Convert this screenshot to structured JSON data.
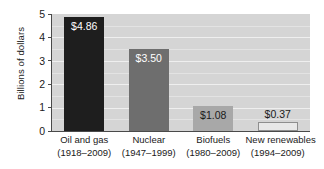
{
  "chart_data": {
    "type": "bar",
    "title": "",
    "xlabel": "",
    "ylabel": "Billions of dollars",
    "ylim": [
      0,
      5
    ],
    "yticks": [
      "0",
      "1",
      "2",
      "3",
      "4",
      "5"
    ],
    "grid": true,
    "legend": "none",
    "categories": [
      "Oil and gas",
      "Nuclear",
      "Biofuels",
      "New renewables"
    ],
    "category_periods": [
      "(1918–2009)",
      "(1947–1999)",
      "(1980–2009)",
      "(1994–2009)"
    ],
    "values": [
      4.86,
      3.5,
      1.08,
      0.37
    ],
    "value_labels": [
      "$4.86",
      "$3.50",
      "$1.08",
      "$0.37"
    ],
    "bar_colors": [
      "#1e1e1e",
      "#6e6e6e",
      "#a8a8a8",
      "#e8e8e8"
    ],
    "plot_background": "#d5d5d5",
    "gridline_color": "#efefef",
    "axis_color": "#4a4a4a"
  },
  "axis": {
    "y_title": "Billions of dollars",
    "ticks": [
      {
        "label": "5",
        "value": 5
      },
      {
        "label": "4",
        "value": 4
      },
      {
        "label": "3",
        "value": 3
      },
      {
        "label": "2",
        "value": 2
      },
      {
        "label": "1",
        "value": 1
      },
      {
        "label": "0",
        "value": 0
      }
    ]
  },
  "bars": [
    {
      "category": "Oil and gas",
      "period": "(1918–2009)",
      "value": 4.86,
      "value_label": "$4.86",
      "color": "#1e1e1e",
      "label_color": "#ffffff",
      "label_position": "inside"
    },
    {
      "category": "Nuclear",
      "period": "(1947–1999)",
      "value": 3.5,
      "value_label": "$3.50",
      "color": "#6e6e6e",
      "label_color": "#ffffff",
      "label_position": "inside"
    },
    {
      "category": "Biofuels",
      "period": "(1980–2009)",
      "value": 1.08,
      "value_label": "$1.08",
      "color": "#a8a8a8",
      "label_color": "#1a1a1a",
      "label_position": "inside"
    },
    {
      "category": "New renewables",
      "period": "(1994–2009)",
      "value": 0.37,
      "value_label": "$0.37",
      "color": "#e8e8e8",
      "label_color": "#1a1a1a",
      "label_position": "above"
    }
  ]
}
